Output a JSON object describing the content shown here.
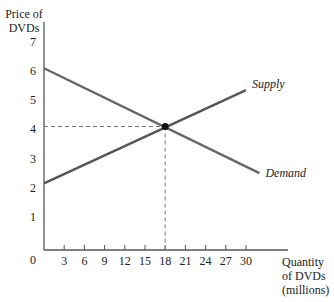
{
  "chart_data": {
    "type": "line",
    "title": "",
    "xlabel": "Quantity of DVDs (millions)",
    "ylabel": "Price of DVDs",
    "xlabel_lines": [
      "Quantity",
      "of DVDs",
      "(millions)"
    ],
    "ylabel_lines": [
      "Price of",
      "DVDs"
    ],
    "x_ticks": [
      3,
      6,
      9,
      12,
      15,
      18,
      21,
      24,
      27,
      30
    ],
    "y_ticks": [
      1,
      2,
      3,
      4,
      5,
      6,
      7
    ],
    "origin_label": "0",
    "xlim": [
      0,
      33
    ],
    "ylim": [
      0,
      7.3
    ],
    "grid": false,
    "series": [
      {
        "name": "Supply",
        "x": [
          0,
          30
        ],
        "y": [
          2.15,
          5.35
        ],
        "color": "#555555"
      },
      {
        "name": "Demand",
        "x": [
          0,
          32
        ],
        "y": [
          6.1,
          2.5
        ],
        "color": "#666666"
      }
    ],
    "equilibrium": {
      "x": 18,
      "y": 4.1,
      "marker": "dot",
      "dashed_guides": true
    },
    "annotations": [
      {
        "text": "Supply",
        "near": "end of supply line"
      },
      {
        "text": "Demand",
        "near": "end of demand line"
      }
    ]
  }
}
